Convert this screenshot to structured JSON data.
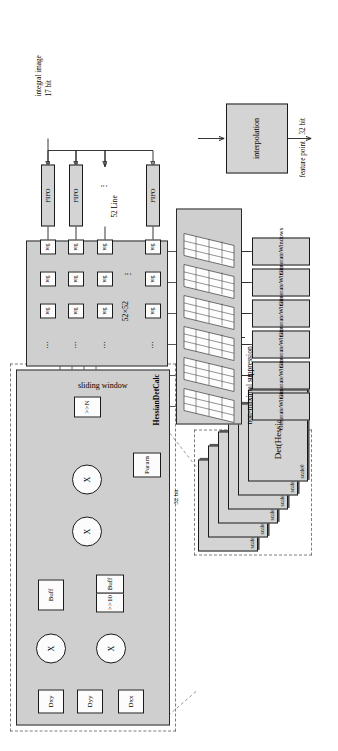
{
  "figure": {
    "orientation": "rotated-90",
    "colors": {
      "block_fill": "#d4d4d4",
      "panel_fill": "#cfcfcf",
      "white_fill": "#fcfcfc",
      "stroke": "#1a1a1a",
      "dashed_stroke": "#7d7d7d"
    }
  },
  "hessian_det_calc": {
    "group_label": "HessianDetCalc",
    "inputs": [
      {
        "label": "Dxy"
      },
      {
        "label": "Dyy"
      },
      {
        "label": "Dxx"
      }
    ],
    "multipliers": [
      {
        "label": "X"
      },
      {
        "label": "X"
      },
      {
        "label": "X"
      },
      {
        "label": "X"
      }
    ],
    "buffers": [
      {
        "label": "Buff"
      },
      {
        "label": "Buff"
      }
    ],
    "shift_right_10": ">>10",
    "param": "Param",
    "shift_right_n": ">>N"
  },
  "det_hessian_stack": {
    "main_label": "Det(Hessian)",
    "scales": [
      "scale5",
      "scale4",
      "scale3",
      "scale2",
      "scale1",
      "scale0"
    ],
    "bus_label": "32 bit"
  },
  "sliding_window": {
    "label": "sliding window",
    "size_label": "52×52",
    "register_label": "reg",
    "ellipsis": "⋯",
    "vertical_ellipsis": "⋮",
    "rows": [
      [
        "reg",
        "reg",
        "reg"
      ],
      [
        "reg",
        "reg",
        "reg"
      ],
      [
        "reg",
        "reg",
        "reg"
      ],
      [
        "reg",
        "reg",
        "reg"
      ]
    ]
  },
  "line_buffers": {
    "input_label_line1": "integral image",
    "input_label_line2": "17 bit",
    "fifo_label": "FIFO",
    "fifos": [
      "FIFO",
      "FIFO",
      "FIFO"
    ],
    "count_label": "52 Line",
    "ellipsis": "⋮"
  },
  "generate_windows": {
    "label": "GenerateWindows",
    "instances": [
      "GenerateWindows",
      "GenerateWindows",
      "GenerateWindows",
      "GenerateWindows",
      "GenerateWindows",
      "GenerateWindows"
    ]
  },
  "non_maximal_suppression": {
    "label": "non-maximal suppression",
    "slab_count": 6,
    "grid_rows": 4,
    "grid_cols": 3
  },
  "interpolation": {
    "label": "interpolation",
    "output_label_line1": "feature point",
    "output_label_line2": "32 bit"
  }
}
